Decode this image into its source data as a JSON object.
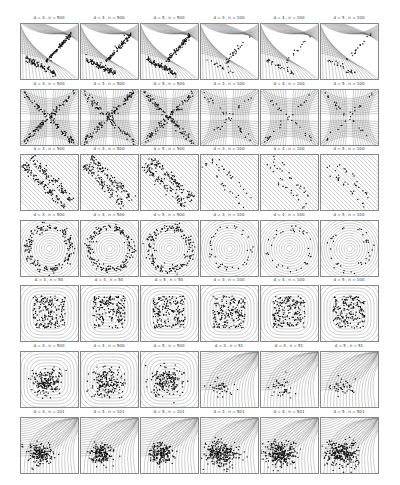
{
  "chart_data": {
    "type": "scatter",
    "layout": {
      "rows": 7,
      "cols": 6,
      "grid": false,
      "legend": "none"
    },
    "panels": [
      {
        "row": 1,
        "title": "d = 3 , n = 500",
        "pattern": "cross-L"
      },
      {
        "row": 1,
        "title": "d = 4 , n = 500",
        "pattern": "cross-L"
      },
      {
        "row": 1,
        "title": "d = 5 , n = 500",
        "pattern": "cross-L"
      },
      {
        "row": 1,
        "title": "d = 3 , n = 100",
        "pattern": "cross-L-sparse"
      },
      {
        "row": 1,
        "title": "d = 4 , n = 100",
        "pattern": "cross-L-sparse"
      },
      {
        "row": 1,
        "title": "d = 5 , n = 100",
        "pattern": "cross-L-sparse"
      },
      {
        "row": 2,
        "title": "d = 3 , n = 500",
        "pattern": "x-cross"
      },
      {
        "row": 2,
        "title": "d = 4 , n = 500",
        "pattern": "x-cross"
      },
      {
        "row": 2,
        "title": "d = 5 , n = 500",
        "pattern": "x-cross"
      },
      {
        "row": 2,
        "title": "d = 3 , n = 100",
        "pattern": "x-cross-sparse"
      },
      {
        "row": 2,
        "title": "d = 4 , n = 100",
        "pattern": "x-cross-sparse"
      },
      {
        "row": 2,
        "title": "d = 5 , n = 100",
        "pattern": "x-cross-sparse"
      },
      {
        "row": 3,
        "title": "d = 3 , n = 500",
        "pattern": "diagonal-band"
      },
      {
        "row": 3,
        "title": "d = 4 , n = 500",
        "pattern": "diagonal-band"
      },
      {
        "row": 3,
        "title": "d = 5 , n = 500",
        "pattern": "diagonal-band"
      },
      {
        "row": 3,
        "title": "d = 3 , n = 100",
        "pattern": "diagonal-band-sparse"
      },
      {
        "row": 3,
        "title": "d = 4 , n = 100",
        "pattern": "diagonal-band-sparse"
      },
      {
        "row": 3,
        "title": "d = 5 , n = 100",
        "pattern": "diagonal-band-sparse"
      },
      {
        "row": 4,
        "title": "d = 3 , n = 500",
        "pattern": "ring"
      },
      {
        "row": 4,
        "title": "d = 4 , n = 500",
        "pattern": "ring"
      },
      {
        "row": 4,
        "title": "d = 5 , n = 500",
        "pattern": "ring"
      },
      {
        "row": 4,
        "title": "d = 3 , n = 100",
        "pattern": "ring-sparse"
      },
      {
        "row": 4,
        "title": "d = 4 , n = 100",
        "pattern": "ring-sparse"
      },
      {
        "row": 4,
        "title": "d = 5 , n = 100",
        "pattern": "ring-sparse"
      },
      {
        "row": 5,
        "title": "d = 3 , n = 50",
        "pattern": "uniform-square"
      },
      {
        "row": 5,
        "title": "d = 4 , n = 50",
        "pattern": "uniform-square"
      },
      {
        "row": 5,
        "title": "d = 5 , n = 50",
        "pattern": "uniform-square"
      },
      {
        "row": 5,
        "title": "d = 3 , n = 100",
        "pattern": "uniform-square"
      },
      {
        "row": 5,
        "title": "d = 4 , n = 100",
        "pattern": "uniform-square"
      },
      {
        "row": 5,
        "title": "d = 5 , n = 100",
        "pattern": "uniform-square"
      },
      {
        "row": 6,
        "title": "d = 3 , n = 500",
        "pattern": "gaussian-blob"
      },
      {
        "row": 6,
        "title": "d = 4 , n = 500",
        "pattern": "gaussian-blob"
      },
      {
        "row": 6,
        "title": "d = 5 , n = 500",
        "pattern": "gaussian-blob"
      },
      {
        "row": 6,
        "title": "d = 3 , n = 51",
        "pattern": "corner-skew-sparse"
      },
      {
        "row": 6,
        "title": "d = 4 , n = 51",
        "pattern": "corner-skew-sparse"
      },
      {
        "row": 6,
        "title": "d = 5 , n = 51",
        "pattern": "corner-skew-sparse"
      },
      {
        "row": 7,
        "title": "d = 3 , n = 101",
        "pattern": "corner-skew"
      },
      {
        "row": 7,
        "title": "d = 4 , n = 101",
        "pattern": "corner-skew"
      },
      {
        "row": 7,
        "title": "d = 5 , n = 101",
        "pattern": "corner-skew"
      },
      {
        "row": 7,
        "title": "d = 3 , n = 501",
        "pattern": "corner-skew-dense"
      },
      {
        "row": 7,
        "title": "d = 4 , n = 501",
        "pattern": "corner-skew-dense"
      },
      {
        "row": 7,
        "title": "d = 5 , n = 501",
        "pattern": "corner-skew-dense"
      }
    ],
    "xlabel": "",
    "ylabel": ""
  }
}
